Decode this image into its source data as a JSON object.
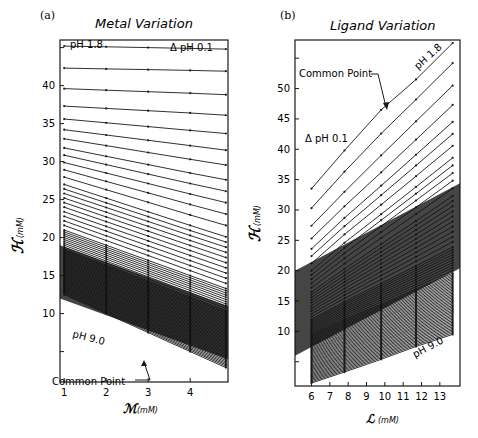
{
  "figure": {
    "panel_a": {
      "label": "(a)",
      "title": "Metal Variation",
      "ylabel_symbol": "ℋ",
      "ylabel_unit": "(mM)",
      "xlabel_symbol": "ℳ",
      "xlabel_unit": "(mM)",
      "annotations": {
        "ph_start": "pH 1.8",
        "ph_end": "pH 9.0",
        "delta": "Δ pH 0.1",
        "common_point": "Common Point"
      }
    },
    "panel_b": {
      "label": "(b)",
      "title": "Ligand Variation",
      "ylabel_symbol": "ℋ",
      "ylabel_unit": "(mM)",
      "xlabel_symbol": "ℒ",
      "xlabel_unit": "(mM)",
      "annotations": {
        "ph_start": "pH 1.8",
        "ph_end": "pH 9.0",
        "delta": "Δ pH 0.1",
        "common_point": "Common Point"
      }
    }
  },
  "chart_data": [
    {
      "type": "line",
      "panel": "(a)",
      "title": "Metal Variation",
      "xlabel": "M (mM)",
      "ylabel": "H (mM)",
      "xticks": [
        1,
        2,
        3,
        4
      ],
      "yticks": [
        10,
        15,
        20,
        25,
        30,
        35,
        40
      ],
      "xlim": [
        0.9,
        4.9
      ],
      "ylim": [
        1,
        46
      ],
      "series_description": "Family of 73 lines, one per pH from 1.8 to 9.0 in steps of 0.1; lines fan out from near-flat at low pH to steeply descending at high pH",
      "series_param": {
        "name": "pH",
        "start": 1.8,
        "end": 9.0,
        "step": 0.1
      },
      "x": [
        1,
        2,
        3,
        4,
        4.85
      ],
      "sample_series": [
        {
          "name": "pH 1.8",
          "values": [
            45.2,
            45.1,
            45.0,
            44.9,
            44.8
          ]
        },
        {
          "name": "pH 1.9",
          "values": [
            42.3,
            42.2,
            42.1,
            42.0,
            41.9
          ]
        },
        {
          "name": "pH 2.0",
          "values": [
            39.6,
            39.4,
            39.2,
            39.0,
            38.8
          ]
        },
        {
          "name": "pH 2.1",
          "values": [
            37.3,
            37.0,
            36.7,
            36.4,
            36.1
          ]
        },
        {
          "name": "pH 2.2",
          "values": [
            35.6,
            35.1,
            34.6,
            34.1,
            33.7
          ]
        },
        {
          "name": "pH 2.3",
          "values": [
            34.2,
            33.5,
            32.8,
            32.1,
            31.5
          ]
        },
        {
          "name": "pH 2.5",
          "values": [
            31.8,
            30.7,
            29.6,
            28.5,
            27.6
          ]
        },
        {
          "name": "pH 3.0",
          "values": [
            27.0,
            25.2,
            23.4,
            21.6,
            20.1
          ]
        },
        {
          "name": "pH 4.0",
          "values": [
            21.0,
            19.0,
            17.0,
            15.0,
            13.3
          ]
        },
        {
          "name": "pH 5.0",
          "values": [
            18.5,
            16.4,
            14.3,
            12.2,
            10.4
          ]
        },
        {
          "name": "pH 9.0",
          "values": [
            12.5,
            10.0,
            7.5,
            5.0,
            2.9
          ]
        }
      ],
      "annotations": [
        "pH 1.8",
        "Δ pH 0.1",
        "pH 9.0",
        "Common Point"
      ],
      "grid": false,
      "dense_band_y_range": [
        12,
        19
      ]
    },
    {
      "type": "line",
      "panel": "(b)",
      "title": "Ligand Variation",
      "xlabel": "L (mM)",
      "ylabel": "H (mM)",
      "xticks": [
        6,
        7,
        8,
        9,
        10,
        11,
        12,
        13
      ],
      "yticks": [
        10,
        15,
        20,
        25,
        30,
        35,
        40,
        45,
        50
      ],
      "xlim": [
        5.1,
        14.1
      ],
      "ylim": [
        1,
        58
      ],
      "series_description": "Family of 73 rising lines, one per pH from 1.8 to 9.0 in steps of 0.1; slopes decrease with increasing pH",
      "series_param": {
        "name": "pH",
        "start": 1.8,
        "end": 9.0,
        "step": 0.1
      },
      "x": [
        6,
        7.8,
        9.8,
        11.7,
        13.7
      ],
      "sample_series": [
        {
          "name": "pH 1.8",
          "values": [
            33.5,
            39.8,
            46.5,
            51.5,
            57.5
          ]
        },
        {
          "name": "pH 1.9",
          "values": [
            30.3,
            36.3,
            42.6,
            48.2,
            54.2
          ]
        },
        {
          "name": "pH 2.0",
          "values": [
            27.4,
            33.0,
            39.0,
            44.6,
            50.5
          ]
        },
        {
          "name": "pH 2.1",
          "values": [
            25.3,
            30.6,
            36.2,
            41.6,
            47.3
          ]
        },
        {
          "name": "pH 2.2",
          "values": [
            23.6,
            28.7,
            34.0,
            39.1,
            44.5
          ]
        },
        {
          "name": "pH 2.5",
          "values": [
            20.0,
            24.6,
            29.3,
            33.8,
            38.6
          ]
        },
        {
          "name": "pH 3.0",
          "values": [
            16.5,
            20.3,
            24.4,
            28.2,
            32.3
          ]
        },
        {
          "name": "pH 4.0",
          "values": [
            12.0,
            14.9,
            17.9,
            20.8,
            23.9
          ]
        },
        {
          "name": "pH 5.0",
          "values": [
            9.5,
            12.0,
            14.5,
            17.0,
            19.6
          ]
        },
        {
          "name": "pH 9.0",
          "values": [
            1.5,
            3.3,
            5.4,
            7.5,
            9.5
          ]
        }
      ],
      "annotations": [
        "pH 1.8",
        "Δ pH 0.1",
        "pH 9.0",
        "Common Point"
      ],
      "grid": false,
      "dense_band_y_range": [
        6,
        20
      ]
    }
  ]
}
